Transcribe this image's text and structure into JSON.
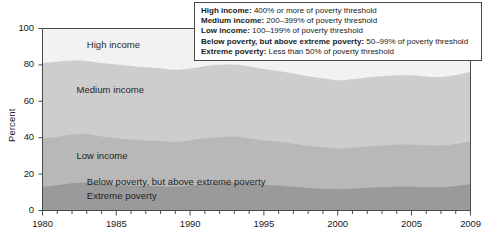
{
  "chart_data": {
    "type": "area",
    "title": "",
    "subtitle": "",
    "xlabel": "",
    "ylabel": "Percent",
    "xlim": [
      1980,
      2009
    ],
    "ylim": [
      0,
      100
    ],
    "grid": false,
    "stacked": true,
    "legend_position": "top-right-box",
    "x_tick_labels": [
      "1980",
      "1985",
      "1990",
      "1995",
      "2000",
      "2005",
      "2009"
    ],
    "x_tick_values": [
      1980,
      1985,
      1990,
      1995,
      2000,
      2005,
      2009
    ],
    "y_tick_labels": [
      "0",
      "20",
      "40",
      "60",
      "80",
      "100"
    ],
    "y_tick_values": [
      0,
      20,
      40,
      60,
      80,
      100
    ],
    "x": [
      1980,
      1981,
      1982,
      1983,
      1984,
      1985,
      1986,
      1987,
      1988,
      1989,
      1990,
      1991,
      1992,
      1993,
      1994,
      1995,
      1996,
      1997,
      1998,
      1999,
      2000,
      2001,
      2002,
      2003,
      2004,
      2005,
      2006,
      2007,
      2008,
      2009
    ],
    "series": [
      {
        "name": "Extreme poverty",
        "color": "#9a9a9a",
        "values": [
          6.5,
          7.2,
          8.0,
          8.3,
          7.8,
          7.4,
          7.2,
          7.0,
          6.9,
          6.8,
          7.3,
          7.8,
          8.2,
          8.4,
          8.0,
          7.5,
          7.2,
          6.8,
          6.4,
          6.2,
          6.0,
          6.2,
          6.5,
          6.7,
          6.8,
          6.9,
          6.8,
          6.8,
          7.2,
          8.0
        ]
      },
      {
        "name": "Below poverty, but above extreme poverty",
        "color": "#9a9a9a",
        "values": [
          6.5,
          6.7,
          7.0,
          7.1,
          6.9,
          6.7,
          6.5,
          6.4,
          6.4,
          6.3,
          6.5,
          6.8,
          7.0,
          7.1,
          6.9,
          6.7,
          6.5,
          6.2,
          6.0,
          5.8,
          5.7,
          5.8,
          6.0,
          6.1,
          6.2,
          6.2,
          6.1,
          6.1,
          6.3,
          6.6
        ]
      },
      {
        "name": "Low income",
        "color": "#b8b8b8",
        "values": [
          26.5,
          26.6,
          26.8,
          26.6,
          26.0,
          25.6,
          25.3,
          25.1,
          24.9,
          24.6,
          24.8,
          25.1,
          25.2,
          25.1,
          24.8,
          24.4,
          24.1,
          23.7,
          23.2,
          22.8,
          22.4,
          22.5,
          22.7,
          22.9,
          23.1,
          23.1,
          22.9,
          22.8,
          23.0,
          23.4
        ]
      },
      {
        "name": "Medium income",
        "color": "#cdcdcd",
        "values": [
          41.5,
          41.2,
          40.6,
          40.2,
          40.4,
          40.5,
          40.4,
          40.2,
          40.0,
          39.6,
          39.4,
          39.6,
          39.7,
          39.6,
          39.4,
          39.2,
          38.9,
          38.6,
          38.2,
          37.8,
          37.4,
          37.6,
          37.9,
          38.1,
          38.2,
          38.1,
          37.8,
          37.6,
          37.9,
          38.3
        ]
      },
      {
        "name": "High income",
        "color": "#f2f2f2",
        "values": [
          19.0,
          18.3,
          17.6,
          17.8,
          18.9,
          19.8,
          20.6,
          21.3,
          21.8,
          22.7,
          22.0,
          20.7,
          19.9,
          19.8,
          20.9,
          22.2,
          23.3,
          24.7,
          26.2,
          27.4,
          28.5,
          27.9,
          26.9,
          26.2,
          25.7,
          25.7,
          26.4,
          26.7,
          25.6,
          23.7
        ]
      }
    ],
    "band_labels": [
      {
        "text": "High income",
        "x": 1983.0,
        "y": 91
      },
      {
        "text": "Medium income",
        "x": 1982.3,
        "y": 66
      },
      {
        "text": "Low income",
        "x": 1982.3,
        "y": 30
      },
      {
        "text": "Below poverty, but above extreme poverty",
        "x": 1983.0,
        "y": 15.5
      },
      {
        "text": "Extreme poverty",
        "x": 1983.0,
        "y": 8.0
      }
    ]
  },
  "legend": {
    "items": [
      {
        "term": "High income:",
        "definition": " 400% or more of poverty threshold"
      },
      {
        "term": "Medium income:",
        "definition": " 200–399% of poverty threshold"
      },
      {
        "term": "Low income:",
        "definition": " 100–199% of poverty threshold"
      },
      {
        "term": "Below poverty, but above extreme poverty:",
        "definition": " 50–99% of poverty threshold"
      },
      {
        "term": "Extreme poverty:",
        "definition": " Less than 50% of poverty threshold"
      }
    ]
  },
  "colors": {
    "axis": "#4a4a4a",
    "text": "#1a1a1a",
    "background": "#ffffff"
  }
}
